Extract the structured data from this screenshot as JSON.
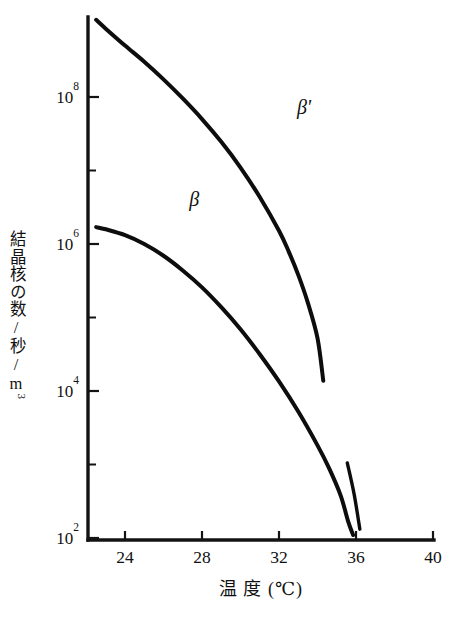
{
  "chart_data": {
    "type": "line",
    "title": "",
    "xlabel": "温 度 (℃)",
    "ylabel": "結晶核の数/秒/m³",
    "xlim": [
      22.4,
      40
    ],
    "ylim_log10": [
      2,
      9.1
    ],
    "grid": false,
    "legend_position": "inline-annotation",
    "x_ticks": [
      24,
      28,
      32,
      36,
      40
    ],
    "x_tick_labels": [
      "24",
      "28",
      "32",
      "36",
      "40"
    ],
    "y_ticks_log10": [
      2,
      3,
      4,
      5,
      6,
      7,
      8
    ],
    "y_tick_labels": [
      "10²",
      "",
      "10⁴",
      "",
      "10⁶",
      "",
      "10⁸"
    ],
    "y_major_labels": [
      {
        "exp": "8",
        "base": "10"
      },
      {
        "exp": "6",
        "base": "10"
      },
      {
        "exp": "4",
        "base": "10"
      },
      {
        "exp": "2",
        "base": "10"
      }
    ],
    "series": [
      {
        "name": "β'",
        "label": "β'",
        "label_x": 33.3,
        "label_y_log10": 7.77,
        "points": [
          {
            "x": 22.5,
            "y_log10": 9.05
          },
          {
            "x": 23.0,
            "y_log10": 8.93
          },
          {
            "x": 24.0,
            "y_log10": 8.7
          },
          {
            "x": 25.0,
            "y_log10": 8.48
          },
          {
            "x": 26.0,
            "y_log10": 8.24
          },
          {
            "x": 27.0,
            "y_log10": 7.98
          },
          {
            "x": 28.0,
            "y_log10": 7.7
          },
          {
            "x": 29.0,
            "y_log10": 7.39
          },
          {
            "x": 30.0,
            "y_log10": 7.04
          },
          {
            "x": 31.0,
            "y_log10": 6.64
          },
          {
            "x": 32.0,
            "y_log10": 6.18
          },
          {
            "x": 32.5,
            "y_log10": 5.9
          },
          {
            "x": 33.0,
            "y_log10": 5.58
          },
          {
            "x": 33.5,
            "y_log10": 5.2
          },
          {
            "x": 34.0,
            "y_log10": 4.72
          },
          {
            "x": 34.3,
            "y_log10": 4.14
          }
        ]
      },
      {
        "name": "β'-lower-branch",
        "label": "",
        "points": [
          {
            "x": 35.55,
            "y_log10": 3.02
          },
          {
            "x": 35.9,
            "y_log10": 2.6
          },
          {
            "x": 36.2,
            "y_log10": 2.12
          }
        ]
      },
      {
        "name": "β",
        "label": "β",
        "label_x": 27.6,
        "label_y_log10": 6.52,
        "points": [
          {
            "x": 22.5,
            "y_log10": 6.23
          },
          {
            "x": 23.0,
            "y_log10": 6.2
          },
          {
            "x": 24.0,
            "y_log10": 6.12
          },
          {
            "x": 25.0,
            "y_log10": 6.0
          },
          {
            "x": 26.0,
            "y_log10": 5.84
          },
          {
            "x": 27.0,
            "y_log10": 5.64
          },
          {
            "x": 28.0,
            "y_log10": 5.41
          },
          {
            "x": 29.0,
            "y_log10": 5.14
          },
          {
            "x": 30.0,
            "y_log10": 4.84
          },
          {
            "x": 31.0,
            "y_log10": 4.5
          },
          {
            "x": 32.0,
            "y_log10": 4.13
          },
          {
            "x": 33.0,
            "y_log10": 3.72
          },
          {
            "x": 34.0,
            "y_log10": 3.26
          },
          {
            "x": 34.6,
            "y_log10": 2.95
          },
          {
            "x": 35.2,
            "y_log10": 2.58
          },
          {
            "x": 35.6,
            "y_log10": 2.22
          },
          {
            "x": 35.85,
            "y_log10": 2.04
          }
        ]
      }
    ]
  },
  "axis": {
    "y_label_full": "結晶核の数/秒/m",
    "y_label_exponent": "3",
    "x_label": "温 度 (℃)"
  },
  "colors": {
    "ink": "#111111",
    "curve": "#0d0d0d",
    "background": "#ffffff"
  }
}
